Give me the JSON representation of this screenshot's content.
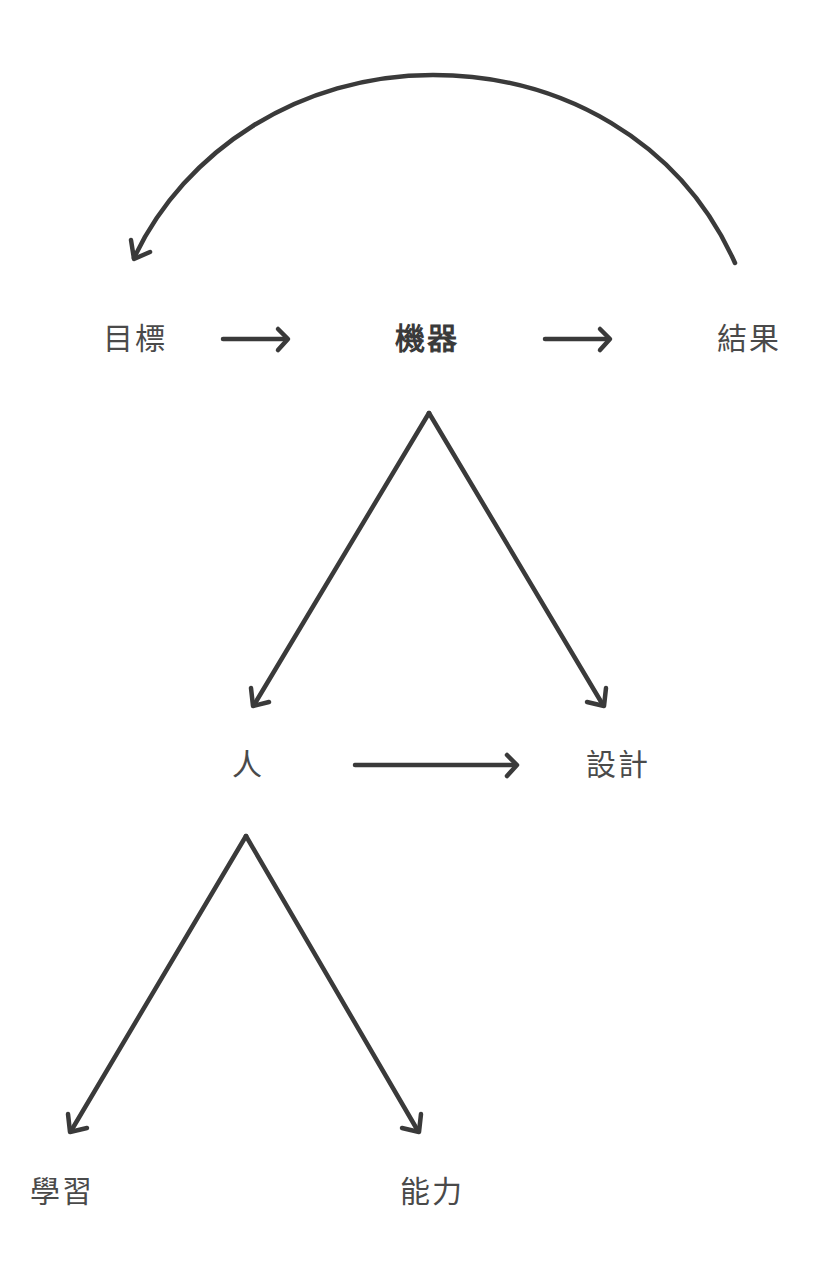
{
  "diagram": {
    "stroke_color": "#3a3a3a",
    "text_color": "#4a4a4a",
    "nodes": [
      {
        "id": "goal",
        "label": "目標"
      },
      {
        "id": "machine",
        "label": "機器"
      },
      {
        "id": "result",
        "label": "結果"
      },
      {
        "id": "person",
        "label": "人"
      },
      {
        "id": "design",
        "label": "設計"
      },
      {
        "id": "learning",
        "label": "學習"
      },
      {
        "id": "ability",
        "label": "能力"
      }
    ],
    "edges": [
      {
        "from": "goal",
        "to": "machine",
        "type": "straight-arrow"
      },
      {
        "from": "machine",
        "to": "result",
        "type": "straight-arrow"
      },
      {
        "from": "result",
        "to": "goal",
        "type": "curved-arrow"
      },
      {
        "from": "machine",
        "to": "person",
        "type": "branch-arrow"
      },
      {
        "from": "machine",
        "to": "design",
        "type": "branch-arrow"
      },
      {
        "from": "person",
        "to": "design",
        "type": "straight-arrow"
      },
      {
        "from": "person",
        "to": "learning",
        "type": "branch-arrow"
      },
      {
        "from": "person",
        "to": "ability",
        "type": "branch-arrow"
      }
    ]
  }
}
